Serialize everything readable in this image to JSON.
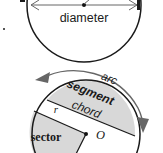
{
  "figure": {
    "colors": {
      "outline": "#1a1a1a",
      "shading": "#d8d8d8",
      "arrow": "#666666",
      "background": "#ffffff",
      "text": "#1a1a1a"
    },
    "top_diagram": {
      "name": "diameter-circle",
      "labels": {
        "diameter": "diameter"
      },
      "center_dot": true,
      "arrow_style": "double-headed"
    },
    "bottom_diagram": {
      "name": "circle-parts",
      "labels": {
        "arc": "arc",
        "segment": "segment",
        "chord": "chord",
        "sector": "sector",
        "radius": "r",
        "center": "O"
      },
      "arc_arrow_start": "left",
      "arc_arrow_end": "down",
      "shaded_regions": [
        "segment",
        "sector"
      ]
    }
  }
}
